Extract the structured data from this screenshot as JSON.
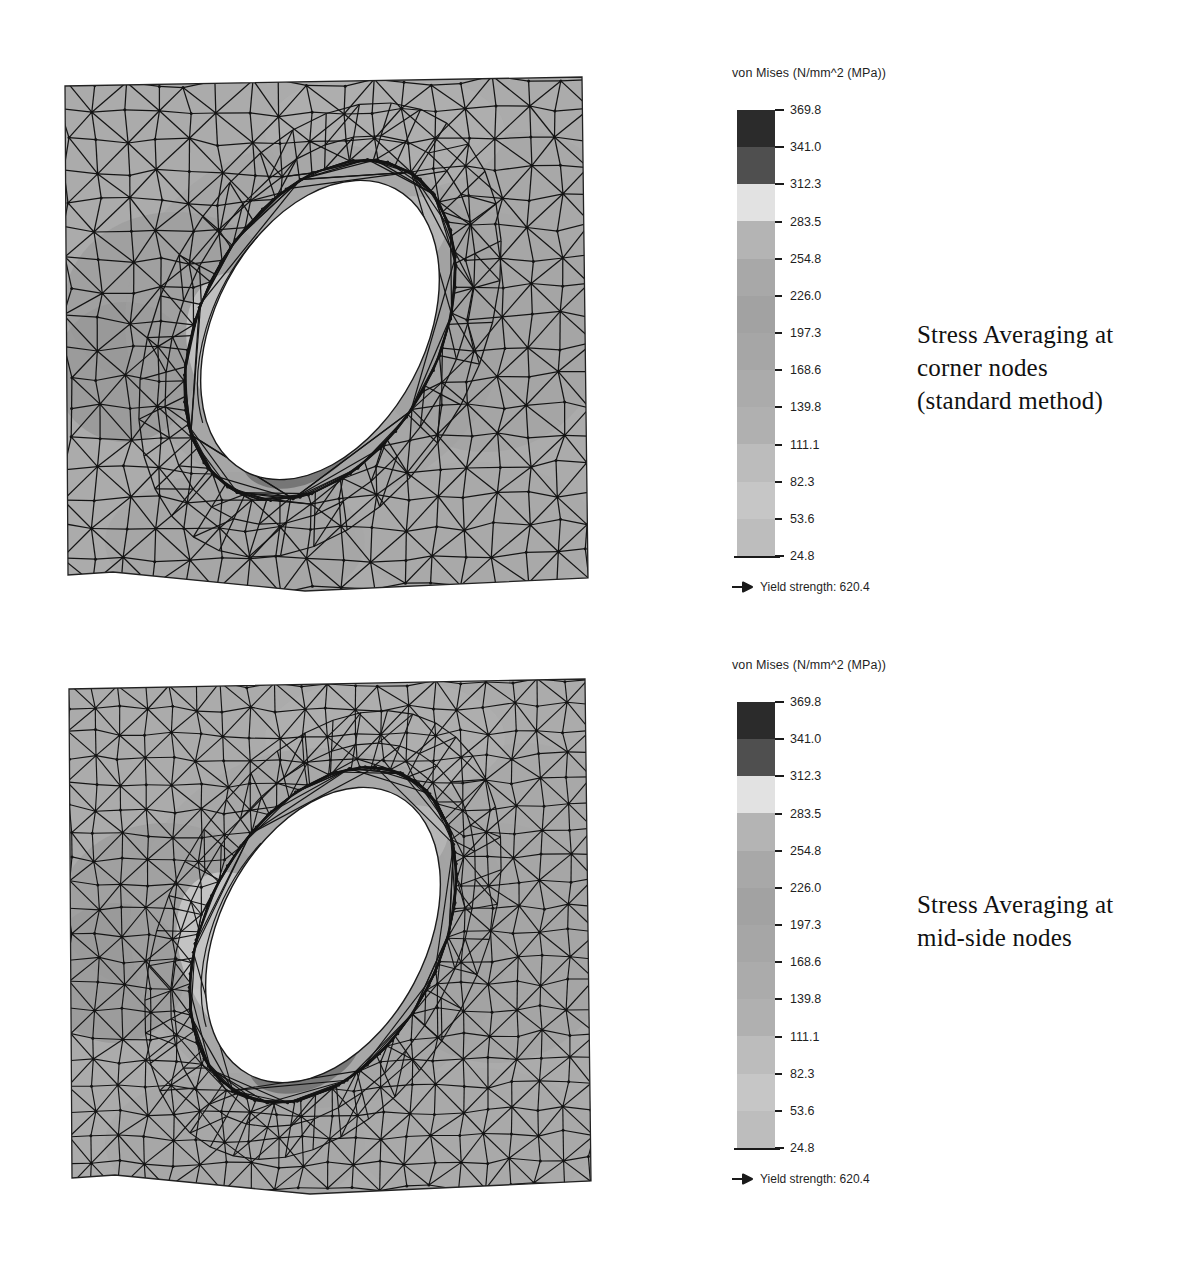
{
  "page": {
    "background": "#ffffff",
    "width": 1187,
    "height": 1270
  },
  "legend_common": {
    "title": "von Mises (N/mm^2 (MPa))",
    "yield_label": "Yield strength: 620.4",
    "yield_arrow_icon": "right-arrow-icon",
    "tick_labels": [
      "369.8",
      "341.0",
      "312.3",
      "283.5",
      "254.8",
      "226.0",
      "197.3",
      "168.6",
      "139.8",
      "111.1",
      "82.3",
      "53.6",
      "24.8"
    ],
    "band_colors": [
      "#2b2b2b",
      "#4f4f4f",
      "#e2e2e2",
      "#b4b4b4",
      "#a8a8a8",
      "#a2a2a2",
      "#a6a6a6",
      "#ababab",
      "#b0b0b0",
      "#bcbcbc",
      "#c6c6c6",
      "#bdbdbd"
    ]
  },
  "panels": [
    {
      "id": "panel-top",
      "caption_lines": [
        "Stress Averaging at",
        "corner nodes",
        "(standard method)"
      ],
      "legend_title": "von Mises (N/mm^2 (MPa))",
      "yield_label": "Yield strength: 620.4",
      "plot_name": "fea-stress-contour-corner-nodes",
      "mesh_density": "coarse"
    },
    {
      "id": "panel-bottom",
      "caption_lines": [
        "Stress Averaging at",
        "mid-side nodes"
      ],
      "legend_title": "von Mises (N/mm^2 (MPa))",
      "yield_label": "Yield strength: 620.4",
      "plot_name": "fea-stress-contour-midside-nodes",
      "mesh_density": "fine"
    }
  ],
  "chart_data": {
    "type": "heatmap",
    "subtitle": "",
    "xlabel": "",
    "ylabel": "",
    "legend_position": "right",
    "grid": false,
    "colorbar": {
      "label": "von Mises (N/mm^2 (MPa))",
      "units": "N/mm^2 (MPa)",
      "min": 24.8,
      "max": 369.8,
      "levels": [
        369.8,
        341.0,
        312.3,
        283.5,
        254.8,
        226.0,
        197.3,
        168.6,
        139.8,
        111.1,
        82.3,
        53.6,
        24.8
      ],
      "band_count": 12,
      "colormap": "grayscale-inverted",
      "yield_strength": 620.4
    },
    "series": [
      {
        "name": "Stress Averaging at corner nodes (standard method)",
        "peak_stress": 369.8,
        "min_stress": 24.8,
        "peak_location": "lower-left edge of elliptical hole",
        "field_mean_estimate": 140.0
      },
      {
        "name": "Stress Averaging at mid-side nodes",
        "peak_stress": 369.8,
        "min_stress": 24.8,
        "peak_location": "lower-left edge of elliptical hole",
        "field_mean_estimate": 140.0
      }
    ],
    "geometry": {
      "shape": "rectangular plate with inclined elliptical hole",
      "element_type": "triangular shell elements",
      "hole_tilt_deg": -35
    }
  }
}
